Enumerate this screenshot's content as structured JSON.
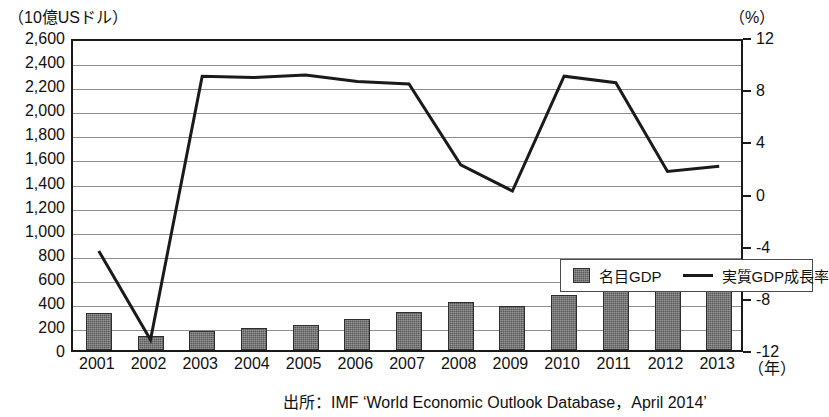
{
  "axis_captions": {
    "left": "（10億USドル）",
    "right": "（%）",
    "x_unit": "（年）"
  },
  "legend": {
    "bar_label": "名目GDP",
    "line_label": "実質GDP成長率"
  },
  "source_note": "出所：IMF ‘World Economic Outlook Database，April 2014’",
  "colors": {
    "bar_fill": "#595959",
    "bar_border": "#2e2e2e",
    "line": "#1a1a1a",
    "grid": "#8e8e8e",
    "frame": "#1a1a1a",
    "background": "#ffffff"
  },
  "chart_data": {
    "type": "bar",
    "title": "",
    "xlabel": "（年）",
    "ylabel": "（10億USドル）",
    "y2label": "（%）",
    "grid": true,
    "legend_position": "inside-lower-right",
    "categories": [
      "2001",
      "2002",
      "2003",
      "2004",
      "2005",
      "2006",
      "2007",
      "2008",
      "2009",
      "2010",
      "2011",
      "2012",
      "2013"
    ],
    "ylim": [
      0,
      2600
    ],
    "yticks": [
      "0",
      "200",
      "400",
      "600",
      "800",
      "1,000",
      "1,200",
      "1,400",
      "1,600",
      "1,800",
      "2,000",
      "2,200",
      "2,400",
      "2,600"
    ],
    "ytick_values": [
      0,
      200,
      400,
      600,
      800,
      1000,
      1200,
      1400,
      1600,
      1800,
      2000,
      2200,
      2400,
      2600
    ],
    "y2lim": [
      -12,
      12
    ],
    "y2ticks": [
      "-12",
      "-8",
      "-4",
      "0",
      "4",
      "8",
      "12"
    ],
    "y2tick_values": [
      -12,
      -8,
      -4,
      0,
      4,
      8,
      12
    ],
    "series": [
      {
        "name": "名目GDP",
        "type": "bar",
        "axis": "left",
        "unit": "10億USドル",
        "values": [
          310,
          115,
          155,
          180,
          210,
          255,
          315,
          395,
          370,
          455,
          540,
          595,
          595
        ]
      },
      {
        "name": "実質GDP成長率",
        "type": "line",
        "axis": "right",
        "unit": "%",
        "values": [
          -4.1,
          -10.9,
          9.3,
          9.2,
          9.4,
          8.9,
          8.7,
          2.5,
          0.5,
          9.3,
          8.8,
          2.0,
          2.4
        ]
      }
    ]
  }
}
